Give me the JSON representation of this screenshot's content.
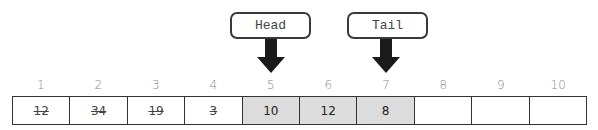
{
  "pointers": {
    "head": {
      "label": "Head",
      "points_to_index": 5
    },
    "tail": {
      "label": "Tail",
      "points_to_index": 7
    }
  },
  "indices": [
    "1",
    "2",
    "3",
    "4",
    "5",
    "6",
    "7",
    "8",
    "9",
    "10"
  ],
  "cells": [
    {
      "value": "12",
      "state": "removed"
    },
    {
      "value": "34",
      "state": "removed"
    },
    {
      "value": "19",
      "state": "removed"
    },
    {
      "value": "3",
      "state": "removed"
    },
    {
      "value": "10",
      "state": "active"
    },
    {
      "value": "12",
      "state": "active"
    },
    {
      "value": "8",
      "state": "active"
    },
    {
      "value": "",
      "state": "empty"
    },
    {
      "value": "",
      "state": "empty"
    },
    {
      "value": "",
      "state": "empty"
    }
  ],
  "colors": {
    "active_fill": "#dcdcdc",
    "border": "#333333",
    "arrow": "#1a1a1a"
  }
}
